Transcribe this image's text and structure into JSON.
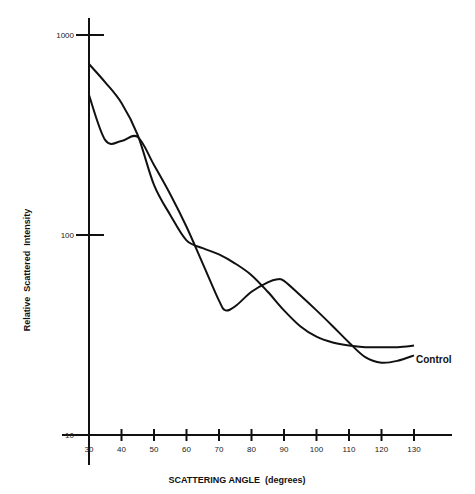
{
  "chart_data": {
    "type": "line",
    "title": "",
    "xlabel": "SCATTERING ANGLE (degrees)",
    "ylabel": "Relative Scattered Intensity",
    "yscale": "log",
    "xlim": [
      30,
      130
    ],
    "ylim": [
      10,
      1000
    ],
    "x_ticks": [
      30,
      40,
      50,
      60,
      70,
      80,
      90,
      100,
      110,
      120,
      130
    ],
    "y_ticks": [
      10,
      100,
      1000
    ],
    "y_tick_labels": [
      "10",
      "100",
      "1000"
    ],
    "grid": false,
    "legend": "none",
    "annotations": [
      {
        "text": "Control",
        "x": 131,
        "y": 25
      }
    ],
    "series": [
      {
        "name": "Sample",
        "x": [
          30,
          35,
          40,
          45,
          50,
          55,
          60,
          65,
          70,
          75,
          80,
          85,
          90,
          95,
          100,
          105,
          110,
          115,
          120,
          125,
          130
        ],
        "values": [
          716,
          580,
          457,
          316,
          178,
          126,
          94,
          86,
          80,
          72,
          63,
          52,
          42,
          35,
          31,
          29,
          28,
          27.5,
          27.5,
          27.5,
          28
        ]
      },
      {
        "name": "Control",
        "x": [
          30,
          35,
          40,
          45,
          50,
          55,
          60,
          65,
          70,
          72,
          75,
          80,
          85,
          88,
          90,
          95,
          100,
          105,
          110,
          115,
          120,
          125,
          130
        ],
        "values": [
          500,
          298,
          295,
          309,
          224,
          160,
          110,
          72,
          47,
          42,
          44,
          52,
          58,
          60,
          59,
          50,
          42,
          35,
          29,
          24.5,
          23,
          23.5,
          25
        ]
      }
    ]
  },
  "axes": {
    "x_title": "SCATTERING ANGLE  (degrees)",
    "y_title": "Relative  Scattered  Intensity",
    "x_tick_labels": [
      "30",
      "40",
      "50",
      "60",
      "70",
      "80",
      "90",
      "100",
      "110",
      "120",
      "130"
    ],
    "y_tick_labels": [
      "10",
      "100",
      "1000"
    ]
  },
  "labels": {
    "control": "Control"
  }
}
